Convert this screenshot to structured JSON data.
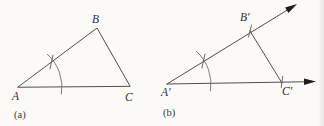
{
  "figure_a": {
    "caption": "(a)",
    "labels": {
      "A": "A",
      "B": "B",
      "C": "C"
    }
  },
  "figure_b": {
    "caption": "(b)",
    "labels": {
      "A_prime": "A′",
      "B_prime": "B′",
      "C_prime": "C′"
    }
  },
  "colors": {
    "background": "#fbfaf7",
    "line": "#4f4f4f",
    "arc": "#6e6e6e",
    "arrowhead": "#1e1e1e",
    "label_text": "#2f2f2f"
  },
  "icons": {
    "arrowhead": "solid-triangle-arrowhead"
  }
}
